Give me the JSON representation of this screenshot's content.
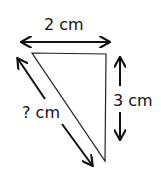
{
  "diagram": {
    "type": "right-triangle",
    "labels": {
      "top": "2 cm",
      "right": "3 cm",
      "hypotenuse": "? cm"
    },
    "colors": {
      "stroke": "#111111",
      "background": "#ffffff"
    }
  }
}
